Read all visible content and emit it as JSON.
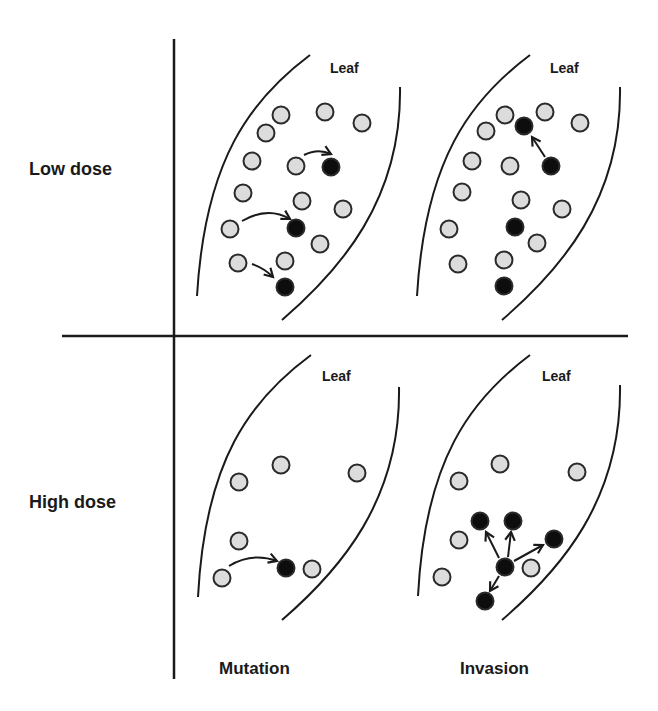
{
  "row_labels": [
    "Low dose",
    "High dose"
  ],
  "column_labels": [
    "Mutation",
    "Invasion"
  ],
  "panels": [
    {
      "id": "low-dose-mutation",
      "leaf_label": "Leaf",
      "cells": [
        {
          "type": "normal",
          "pos": [
            281,
            115
          ]
        },
        {
          "type": "normal",
          "pos": [
            266,
            133
          ]
        },
        {
          "type": "normal",
          "pos": [
            325,
            112
          ]
        },
        {
          "type": "normal",
          "pos": [
            362,
            123
          ]
        },
        {
          "type": "normal",
          "pos": [
            252,
            161
          ]
        },
        {
          "type": "normal",
          "pos": [
            296,
            166
          ]
        },
        {
          "type": "mutant",
          "pos": [
            331,
            167
          ]
        },
        {
          "type": "normal",
          "pos": [
            243,
            193
          ]
        },
        {
          "type": "normal",
          "pos": [
            302,
            201
          ]
        },
        {
          "type": "normal",
          "pos": [
            343,
            209
          ]
        },
        {
          "type": "normal",
          "pos": [
            230,
            229
          ]
        },
        {
          "type": "mutant",
          "pos": [
            296,
            228
          ]
        },
        {
          "type": "normal",
          "pos": [
            320,
            244
          ]
        },
        {
          "type": "normal",
          "pos": [
            238,
            263
          ]
        },
        {
          "type": "normal",
          "pos": [
            285,
            261
          ]
        },
        {
          "type": "mutant",
          "pos": [
            285,
            287
          ]
        }
      ],
      "arrows": [
        {
          "kind": "mutation",
          "path": "M304,155 Q318,148 331,154"
        },
        {
          "kind": "mutation",
          "path": "M242,221 Q268,206 290,219"
        },
        {
          "kind": "mutation",
          "path": "M252,264 Q264,268 273,277"
        }
      ]
    },
    {
      "id": "low-dose-invasion",
      "leaf_label": "Leaf",
      "cells": [
        {
          "type": "normal",
          "pos": [
            505,
            115
          ]
        },
        {
          "type": "normal",
          "pos": [
            486,
            131
          ]
        },
        {
          "type": "normal",
          "pos": [
            545,
            112
          ]
        },
        {
          "type": "normal",
          "pos": [
            580,
            123
          ]
        },
        {
          "type": "mutant",
          "pos": [
            524,
            126
          ]
        },
        {
          "type": "normal",
          "pos": [
            472,
            161
          ]
        },
        {
          "type": "normal",
          "pos": [
            510,
            166
          ]
        },
        {
          "type": "mutant",
          "pos": [
            551,
            166
          ]
        },
        {
          "type": "normal",
          "pos": [
            462,
            192
          ]
        },
        {
          "type": "normal",
          "pos": [
            521,
            200
          ]
        },
        {
          "type": "normal",
          "pos": [
            562,
            209
          ]
        },
        {
          "type": "normal",
          "pos": [
            449,
            229
          ]
        },
        {
          "type": "mutant",
          "pos": [
            515,
            227
          ]
        },
        {
          "type": "normal",
          "pos": [
            537,
            243
          ]
        },
        {
          "type": "normal",
          "pos": [
            458,
            264
          ]
        },
        {
          "type": "normal",
          "pos": [
            504,
            260
          ]
        },
        {
          "type": "mutant",
          "pos": [
            504,
            286
          ]
        }
      ],
      "arrows": [
        {
          "kind": "invasion",
          "path": "M545,157 L532,137"
        }
      ]
    },
    {
      "id": "high-dose-mutation",
      "leaf_label": "Leaf",
      "cells": [
        {
          "type": "normal",
          "pos": [
            281,
            465
          ]
        },
        {
          "type": "normal",
          "pos": [
            239,
            482
          ]
        },
        {
          "type": "normal",
          "pos": [
            357,
            473
          ]
        },
        {
          "type": "normal",
          "pos": [
            239,
            541
          ]
        },
        {
          "type": "normal",
          "pos": [
            222,
            578
          ]
        },
        {
          "type": "mutant",
          "pos": [
            286,
            568
          ]
        },
        {
          "type": "normal",
          "pos": [
            312,
            569
          ]
        }
      ],
      "arrows": [
        {
          "kind": "mutation",
          "path": "M229,566 Q252,552 277,561"
        }
      ]
    },
    {
      "id": "high-dose-invasion",
      "leaf_label": "Leaf",
      "cells": [
        {
          "type": "normal",
          "pos": [
            500,
            464
          ]
        },
        {
          "type": "normal",
          "pos": [
            459,
            481
          ]
        },
        {
          "type": "normal",
          "pos": [
            577,
            472
          ]
        },
        {
          "type": "normal",
          "pos": [
            459,
            540
          ]
        },
        {
          "type": "normal",
          "pos": [
            442,
            577
          ]
        },
        {
          "type": "mutant",
          "pos": [
            480,
            521
          ]
        },
        {
          "type": "mutant",
          "pos": [
            513,
            521
          ]
        },
        {
          "type": "mutant",
          "pos": [
            554,
            539
          ]
        },
        {
          "type": "mutant",
          "pos": [
            505,
            567
          ]
        },
        {
          "type": "normal",
          "pos": [
            531,
            568
          ]
        },
        {
          "type": "mutant",
          "pos": [
            485,
            601
          ]
        }
      ],
      "arrows": [
        {
          "kind": "invasion",
          "path": "M499,558 L486,532"
        },
        {
          "kind": "invasion",
          "path": "M508,557 L511,532"
        },
        {
          "kind": "invasion",
          "path": "M514,561 L543,545"
        },
        {
          "kind": "invasion",
          "path": "M499,576 L490,591"
        }
      ]
    }
  ],
  "colors": {
    "normal_fill": "#dcdcdc",
    "mutant_fill": "#0d0d0d",
    "stroke": "#1a1a1a"
  }
}
